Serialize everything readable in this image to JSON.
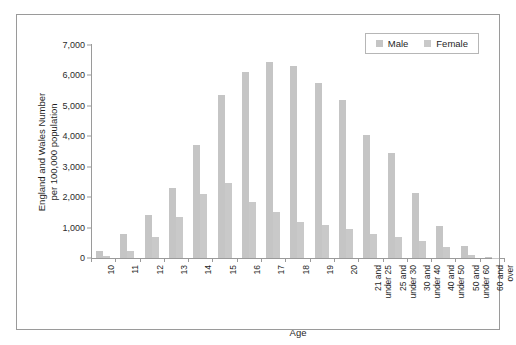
{
  "chart_data": {
    "type": "bar",
    "title": "",
    "xlabel": "Age",
    "ylabel": "England and Wales Number per 100,000 population",
    "ylabel_line1": "England and Wales Number",
    "ylabel_line2": "per 100,000 population",
    "ylim": [
      0,
      7000
    ],
    "ytick_values": [
      0,
      1000,
      2000,
      3000,
      4000,
      5000,
      6000,
      7000
    ],
    "ytick_labels": [
      "0",
      "1,000",
      "2,000",
      "3,000",
      "4,000",
      "5,000",
      "6,000",
      "7,000"
    ],
    "grid": false,
    "legend_position": "top-right",
    "categories": [
      "10",
      "11",
      "12",
      "13",
      "14",
      "15",
      "16",
      "17",
      "18",
      "19",
      "20",
      "21 and under 25",
      "25 and under 30",
      "30 and under 40",
      "40 and under 50",
      "50 and under 60",
      "60 and over"
    ],
    "category_lines": [
      [
        "10"
      ],
      [
        "11"
      ],
      [
        "12"
      ],
      [
        "13"
      ],
      [
        "14"
      ],
      [
        "15"
      ],
      [
        "16"
      ],
      [
        "17"
      ],
      [
        "18"
      ],
      [
        "19"
      ],
      [
        "20"
      ],
      [
        "21 and",
        "under 25"
      ],
      [
        "25 and",
        "under 30"
      ],
      [
        "30 and",
        "under 40"
      ],
      [
        "40 and",
        "under 50"
      ],
      [
        "50 and",
        "under 60"
      ],
      [
        "60 and",
        "over"
      ]
    ],
    "series": [
      {
        "name": "Male",
        "color": "#c5c5c5",
        "values": [
          230,
          800,
          1400,
          2300,
          3700,
          5350,
          6100,
          6450,
          6300,
          5750,
          5200,
          4050,
          3450,
          2150,
          1050,
          400,
          30
        ]
      },
      {
        "name": "Female",
        "color": "#c9c9c9",
        "values": [
          60,
          220,
          700,
          1350,
          2100,
          2450,
          1850,
          1500,
          1200,
          1100,
          950,
          800,
          700,
          550,
          350,
          100,
          15
        ]
      }
    ]
  },
  "legend": {
    "items": [
      {
        "label": "Male",
        "color": "#c5c5c5"
      },
      {
        "label": "Female",
        "color": "#c9c9c9"
      }
    ]
  }
}
